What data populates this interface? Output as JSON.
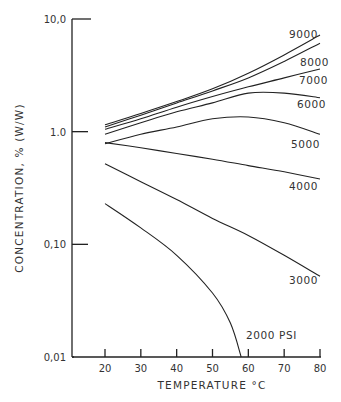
{
  "chart_data": {
    "type": "line",
    "title": "",
    "xlabel": "TEMPERATURE °C",
    "ylabel": "CONCENTRATION, % (W/W)",
    "yscale": "log",
    "xlim": [
      20,
      80
    ],
    "ylim": [
      0.01,
      10.0
    ],
    "x_ticks": [
      20,
      30,
      40,
      50,
      60,
      70,
      80
    ],
    "x_tick_labels": [
      "20",
      "30",
      "40",
      "50",
      "60",
      "70",
      "80"
    ],
    "y_ticks": [
      0.01,
      0.1,
      1.0,
      10.0
    ],
    "y_tick_labels": [
      "0,01",
      "0,10",
      "1.0",
      "10,0"
    ],
    "grid": false,
    "legend": "inline labels at right end of curves",
    "series": [
      {
        "name": "9000",
        "x": [
          20,
          30,
          40,
          50,
          60,
          70,
          80
        ],
        "values": [
          1.15,
          1.45,
          1.85,
          2.4,
          3.3,
          4.8,
          7.2
        ]
      },
      {
        "name": "8000",
        "x": [
          20,
          30,
          40,
          50,
          60,
          70,
          80
        ],
        "values": [
          1.1,
          1.4,
          1.8,
          2.3,
          3.0,
          4.2,
          6.1
        ]
      },
      {
        "name": "7000",
        "x": [
          20,
          30,
          40,
          50,
          60,
          70,
          80
        ],
        "values": [
          1.05,
          1.3,
          1.65,
          2.05,
          2.5,
          3.0,
          3.6
        ]
      },
      {
        "name": "6000",
        "x": [
          20,
          30,
          40,
          50,
          60,
          70,
          80
        ],
        "values": [
          0.95,
          1.2,
          1.5,
          1.8,
          2.2,
          2.2,
          2.0
        ]
      },
      {
        "name": "5000",
        "x": [
          20,
          30,
          40,
          50,
          60,
          70,
          80
        ],
        "values": [
          0.78,
          0.95,
          1.1,
          1.3,
          1.35,
          1.2,
          0.95
        ]
      },
      {
        "name": "4000",
        "x": [
          20,
          30,
          40,
          50,
          60,
          70,
          80
        ],
        "values": [
          0.8,
          0.72,
          0.64,
          0.57,
          0.5,
          0.44,
          0.38
        ]
      },
      {
        "name": "3000",
        "x": [
          20,
          30,
          40,
          50,
          60,
          70,
          80
        ],
        "values": [
          0.52,
          0.36,
          0.25,
          0.17,
          0.12,
          0.08,
          0.052
        ]
      },
      {
        "name": "2000 PSI",
        "x": [
          20,
          30,
          40,
          50,
          55,
          58
        ],
        "values": [
          0.23,
          0.14,
          0.08,
          0.037,
          0.02,
          0.01
        ]
      }
    ],
    "annotations": [
      "9000",
      "8000",
      "7000",
      "6000",
      "5000",
      "4000",
      "3000",
      "2000 PSI"
    ]
  },
  "labels": {
    "xlabel": "TEMPERATURE °C",
    "ylabel": "CONCENTRATION, % (W/W)"
  }
}
